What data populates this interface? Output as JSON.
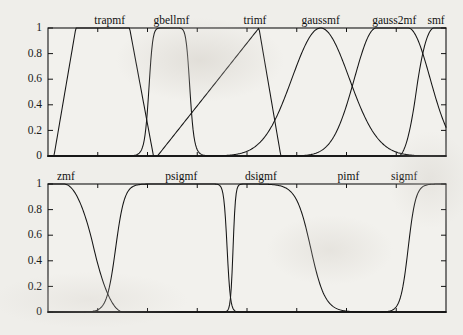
{
  "page": {
    "width": 463,
    "height": 335,
    "background_color": "#efeeea",
    "ink_color": "#151515",
    "plot_face_color": "#f2f1ed"
  },
  "chart_data": [
    {
      "type": "line",
      "id": "membership-functions-top",
      "title": "",
      "xlabel": "",
      "ylabel": "",
      "xlim": [
        0,
        100
      ],
      "ylim": [
        0,
        1
      ],
      "grid": false,
      "legend_position": "inline-above-curve",
      "yticks": [
        0,
        0.2,
        0.4,
        0.6,
        0.8,
        1
      ],
      "ytick_labels": [
        "0",
        "0.2",
        "0.4",
        "0.6",
        "0.8",
        "1"
      ],
      "xticks": [
        0,
        12.5,
        25,
        37.5,
        50,
        62.5,
        75,
        87.5,
        100
      ],
      "xtick_labels": [
        "",
        "",
        "",
        "",
        "",
        "",
        "",
        "",
        ""
      ],
      "series": [
        {
          "name": "trapmf",
          "label_x": 15.5,
          "mf": "trapmf",
          "params": [
            1.5,
            7.0,
            20.5,
            26.5
          ],
          "values": [
            0,
            0.25,
            0.55,
            0.82,
            1,
            1,
            1,
            1,
            0.84,
            0.5,
            0.12,
            0,
            0,
            0,
            0,
            0,
            0
          ]
        },
        {
          "name": "gbellmf",
          "label_x": 31.0,
          "mf": "gbellmf",
          "params": [
            5.2,
            5.0,
            30.5
          ],
          "values": [
            0,
            0,
            0,
            0,
            0.02,
            0.25,
            0.85,
            1,
            1,
            1,
            0.95,
            0.4,
            0.03,
            0,
            0,
            0,
            0
          ]
        },
        {
          "name": "trimf",
          "label_x": 52.0,
          "mf": "trimf",
          "params": [
            27.5,
            53.0,
            58.5
          ],
          "values": [
            0,
            0,
            0,
            0,
            0,
            0,
            0.05,
            0.25,
            0.5,
            0.72,
            0.92,
            1,
            0.4,
            0,
            0,
            0,
            0
          ]
        },
        {
          "name": "gaussmf",
          "label_x": 68.5,
          "mf": "gaussmf",
          "params": [
            7.2,
            68.5
          ],
          "values": [
            0,
            0,
            0,
            0,
            0,
            0,
            0,
            0.02,
            0.1,
            0.32,
            0.68,
            0.95,
            1,
            0.82,
            0.35,
            0.05,
            0
          ]
        },
        {
          "name": "gauss2mf",
          "label_x": 87.0,
          "mf": "gauss2mf",
          "params": [
            5.5,
            82.5,
            5.5,
            90.5
          ],
          "values": [
            0,
            0,
            0,
            0,
            0,
            0,
            0,
            0,
            0,
            0.02,
            0.12,
            0.45,
            0.88,
            1,
            1,
            0.62,
            0.04
          ]
        },
        {
          "name": "smf",
          "label_x": 97.5,
          "mf": "smf",
          "params": [
            88.0,
            97.0
          ],
          "values": [
            0,
            0,
            0,
            0,
            0,
            0,
            0,
            0,
            0,
            0,
            0,
            0,
            0,
            0.05,
            0.45,
            0.92,
            1
          ]
        }
      ]
    },
    {
      "type": "line",
      "id": "membership-functions-bottom",
      "title": "",
      "xlabel": "",
      "ylabel": "",
      "xlim": [
        0,
        100
      ],
      "ylim": [
        0,
        1
      ],
      "grid": false,
      "legend_position": "inline-above-curve",
      "yticks": [
        0,
        0.2,
        0.4,
        0.6,
        0.8,
        1
      ],
      "ytick_labels": [
        "0",
        "0.2",
        "0.4",
        "0.6",
        "0.8",
        "1"
      ],
      "xticks": [
        0,
        12.5,
        25,
        37.5,
        50,
        62.5,
        75,
        87.5,
        100
      ],
      "xtick_labels": [
        "",
        "",
        "",
        "",
        "",
        "",
        "",
        "",
        ""
      ],
      "series": [
        {
          "name": "zmf",
          "label_x": 4.5,
          "mf": "zmf",
          "params": [
            4.0,
            19.0
          ],
          "values": [
            1,
            1,
            1,
            0.97,
            0.82,
            0.5,
            0.18,
            0.03,
            0,
            0,
            0,
            0,
            0,
            0,
            0,
            0,
            0
          ]
        },
        {
          "name": "psigmf",
          "label_x": 33.5,
          "mf": "psigmf",
          "params": [
            0.9,
            17.0,
            -2.4,
            45.0
          ],
          "values": [
            0,
            0,
            0,
            0,
            0.02,
            0.2,
            0.72,
            0.96,
            1,
            1,
            1,
            0.98,
            0.2,
            0,
            0,
            0,
            0
          ]
        },
        {
          "name": "dsigmf",
          "label_x": 53.5,
          "mf": "dsigmf",
          "params": [
            3.2,
            46.5,
            0.55,
            66.0
          ],
          "values": [
            0,
            0,
            0,
            0,
            0,
            0,
            0,
            0,
            0.35,
            1,
            1,
            0.98,
            0.82,
            0.4,
            0.08,
            0.01,
            0
          ]
        },
        {
          "name": "pimf",
          "label_x": 75.5,
          "mf": "pimf",
          "params": [
            56.0,
            68.0,
            83.0,
            92.0
          ],
          "values": [
            0,
            0,
            0,
            0,
            0,
            0,
            0,
            0,
            0,
            0.02,
            0.22,
            0.75,
            1,
            1,
            1,
            0.55,
            0.02
          ]
        },
        {
          "name": "sigmf",
          "label_x": 89.5,
          "mf": "sigmf",
          "params": [
            1.05,
            90.5
          ],
          "values": [
            0,
            0,
            0,
            0,
            0,
            0,
            0,
            0,
            0,
            0,
            0,
            0,
            0,
            0.02,
            0.3,
            0.9,
            1
          ]
        }
      ]
    }
  ]
}
